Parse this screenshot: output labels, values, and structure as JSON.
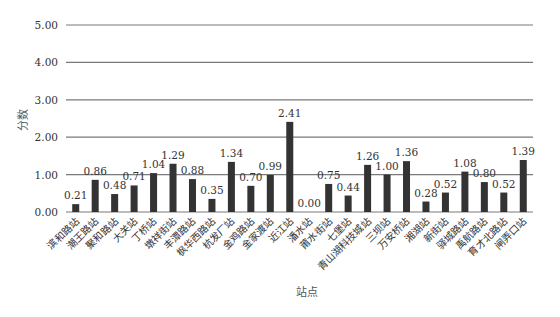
{
  "chart_data": {
    "type": "bar",
    "title": "",
    "xlabel": "站点",
    "ylabel": "分数",
    "ylim": [
      0,
      5
    ],
    "yticks": [
      "0.00",
      "1.00",
      "2.00",
      "3.00",
      "4.00",
      "5.00"
    ],
    "grid": true,
    "legend": "none",
    "data_labels": true,
    "bar_color": "#333333",
    "categories": [
      "滨和路站",
      "潮王路站",
      "聚和路站",
      "大关站",
      "丁桥站",
      "墩祥街站",
      "丰潭路站",
      "枫华西路站",
      "杭发厂站",
      "金鸡路站",
      "金家渡站",
      "近江站",
      "潘水站",
      "莆水街站",
      "七堡站",
      "青山湖科技城站",
      "三坝站",
      "万安桥站",
      "湘湖站",
      "新街站",
      "驿城路站",
      "禹航路站",
      "育才北路站",
      "闸弄口站"
    ],
    "values": [
      0.21,
      0.86,
      0.48,
      0.71,
      1.04,
      1.29,
      0.88,
      0.35,
      1.34,
      0.7,
      0.99,
      2.41,
      0.0,
      0.75,
      0.44,
      1.26,
      1.0,
      1.36,
      0.28,
      0.52,
      1.08,
      0.8,
      0.52,
      1.39
    ],
    "value_labels": [
      "0.21",
      "0.86",
      "0.48",
      "0.71",
      "1.04",
      "1.29",
      "0.88",
      "0.35",
      "1.34",
      "0.70",
      "0.99",
      "2.41",
      "0.00",
      "0.75",
      "0.44",
      "1.26",
      "1.00",
      "1.36",
      "0.28",
      "0.52",
      "1.08",
      "0.80",
      "0.52",
      "1.39"
    ]
  }
}
